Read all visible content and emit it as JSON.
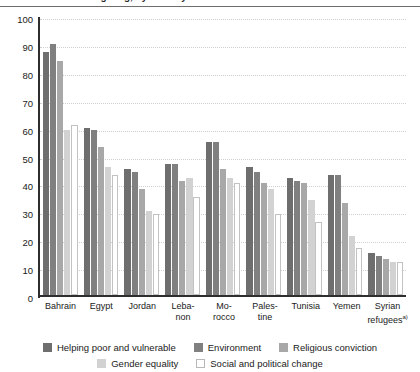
{
  "title": {
    "text": "Figure: Reasons for giving, by country",
    "rule_color": "#6e6e6e"
  },
  "chart_data": {
    "type": "bar",
    "title": "Reasons for giving, by country",
    "xlabel": "",
    "ylabel": "",
    "ylim": [
      0,
      100
    ],
    "yticks": [
      0,
      10,
      20,
      30,
      40,
      50,
      60,
      70,
      80,
      90,
      100
    ],
    "grid": true,
    "legend_position": "bottom",
    "categories": [
      "Bahrain",
      "Egypt",
      "Jordan",
      "Leba-\nnon",
      "Mo-\nrocco",
      "Pales-\ntine",
      "Tunisia",
      "Yemen",
      "Syrian\nrefugees"
    ],
    "category_labels": [
      {
        "line1": "Bahrain",
        "line2": "",
        "sup": ""
      },
      {
        "line1": "Egypt",
        "line2": "",
        "sup": ""
      },
      {
        "line1": "Jordan",
        "line2": "",
        "sup": ""
      },
      {
        "line1": "Leba-",
        "line2": "non",
        "sup": ""
      },
      {
        "line1": "Mo-",
        "line2": "rocco",
        "sup": ""
      },
      {
        "line1": "Pales-",
        "line2": "tine",
        "sup": ""
      },
      {
        "line1": "Tunisia",
        "line2": "",
        "sup": ""
      },
      {
        "line1": "Yemen",
        "line2": "",
        "sup": ""
      },
      {
        "line1": "Syrian",
        "line2": "refugees",
        "sup": "a)"
      }
    ],
    "series": [
      {
        "name": "Helping poor and vulnerable",
        "color": "#6e6e6e",
        "values": [
          87,
          60,
          45,
          47,
          55,
          46,
          42,
          43,
          15
        ]
      },
      {
        "name": "Environment",
        "color": "#808080",
        "values": [
          90,
          59,
          44,
          47,
          55,
          44,
          41,
          43,
          14
        ]
      },
      {
        "name": "Religious conviction",
        "color": "#a8a8a8",
        "values": [
          84,
          53,
          38,
          41,
          45,
          40,
          40,
          33,
          13
        ]
      },
      {
        "name": "Gender equality",
        "color": "#d2d2d2",
        "values": [
          59,
          46,
          30,
          42,
          42,
          38,
          34,
          21,
          12
        ]
      },
      {
        "name": "Social and political change",
        "color": "#ffffff",
        "values": [
          61,
          43,
          29,
          35,
          40,
          29,
          26,
          17,
          12
        ]
      }
    ]
  },
  "legend": {
    "row1": [
      {
        "label": "Helping poor and vulnerable",
        "swatch": "sw0"
      },
      {
        "label": "Environment",
        "swatch": "sw1"
      },
      {
        "label": "Religious conviction",
        "swatch": "sw2"
      }
    ],
    "row2": [
      {
        "label": "Gender equality",
        "swatch": "sw3"
      },
      {
        "label": "Social and political change",
        "swatch": "sw4"
      }
    ]
  }
}
